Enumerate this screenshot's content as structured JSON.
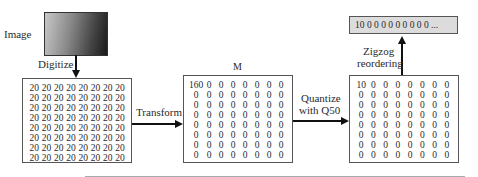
{
  "labels": {
    "image": "Image",
    "digitize": "Digitize",
    "transform": "Transform",
    "m": "M",
    "quantize_line1": "Quantize",
    "quantize_line2": "with Q50",
    "zigzag_line1": "Zigzog",
    "zigzag_line2": "reordering"
  },
  "sequence": "10 0 0 0 0 0 0 0 0 0   ...",
  "matrices": {
    "input": [
      [
        "20",
        "20",
        "20",
        "20",
        "20",
        "20",
        "20",
        "20"
      ],
      [
        "20",
        "20",
        "20",
        "20",
        "20",
        "20",
        "20",
        "20"
      ],
      [
        "20",
        "20",
        "20",
        "20",
        "20",
        "20",
        "20",
        "20"
      ],
      [
        "20",
        "20",
        "20",
        "20",
        "20",
        "20",
        "20",
        "20"
      ],
      [
        "20",
        "20",
        "20",
        "20",
        "20",
        "20",
        "20",
        "20"
      ],
      [
        "20",
        "20",
        "20",
        "20",
        "20",
        "20",
        "20",
        "20"
      ],
      [
        "20",
        "20",
        "20",
        "20",
        "20",
        "20",
        "20",
        "20"
      ],
      [
        "20",
        "20",
        "20",
        "20",
        "20",
        "20",
        "20",
        "20"
      ]
    ],
    "transformed": [
      [
        "160",
        "0",
        "0",
        "0",
        "0",
        "0",
        "0",
        "0"
      ],
      [
        "0",
        "0",
        "0",
        "0",
        "0",
        "0",
        "0",
        "0"
      ],
      [
        "0",
        "0",
        "0",
        "0",
        "0",
        "0",
        "0",
        "0"
      ],
      [
        "0",
        "0",
        "0",
        "0",
        "0",
        "0",
        "0",
        "0"
      ],
      [
        "0",
        "0",
        "0",
        "0",
        "0",
        "0",
        "0",
        "0"
      ],
      [
        "0",
        "0",
        "0",
        "0",
        "0",
        "0",
        "0",
        "0"
      ],
      [
        "0",
        "0",
        "0",
        "0",
        "0",
        "0",
        "0",
        "0"
      ],
      [
        "0",
        "0",
        "0",
        "0",
        "0",
        "0",
        "0",
        "0"
      ]
    ],
    "quantized": [
      [
        "10",
        "0",
        "0",
        "0",
        "0",
        "0",
        "0",
        "0"
      ],
      [
        "0",
        "0",
        "0",
        "0",
        "0",
        "0",
        "0",
        "0"
      ],
      [
        "0",
        "0",
        "0",
        "0",
        "0",
        "0",
        "0",
        "0"
      ],
      [
        "0",
        "0",
        "0",
        "0",
        "0",
        "0",
        "0",
        "0"
      ],
      [
        "0",
        "0",
        "0",
        "0",
        "0",
        "0",
        "0",
        "0"
      ],
      [
        "0",
        "0",
        "0",
        "0",
        "0",
        "0",
        "0",
        "0"
      ],
      [
        "0",
        "0",
        "0",
        "0",
        "0",
        "0",
        "0",
        "0"
      ],
      [
        "0",
        "0",
        "0",
        "0",
        "0",
        "0",
        "0",
        "0"
      ]
    ]
  }
}
